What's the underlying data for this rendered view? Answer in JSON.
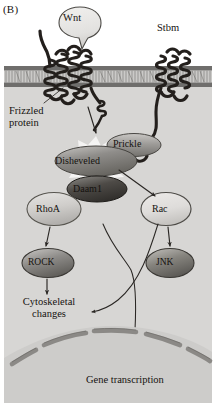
{
  "figure": {
    "panel_label": "(B)",
    "type": "planar-cell-polarity-wnt-signaling-pathway",
    "background_extracellular": "#ffffff",
    "background_cytoplasm": "#d7d6d4",
    "background_nucleus": "#cdccca",
    "membrane_color": "#6f6f6f",
    "protein_dark": "#231f1c",
    "text_color": "#15120f"
  },
  "labels": {
    "wnt": "Wnt",
    "stbm": "Stbm",
    "frizzled": "Frizzled\nprotein",
    "frizzled_line1": "Frizzled",
    "frizzled_line2": "protein",
    "prickle": "Prickle",
    "disheveled": "Disheveled",
    "daam1": "Daam1",
    "rhoa": "RhoA",
    "rac": "Rac",
    "rock": "ROCK",
    "jnk": "JNK",
    "cytoskeletal_line1": "Cytoskeletal",
    "cytoskeletal_line2": "changes",
    "gene_transcription": "Gene transcription"
  },
  "nodes": [
    {
      "id": "wnt",
      "label": "Wnt",
      "shape": "ligand-oval",
      "fill": "#e4e3e1",
      "cx": 80,
      "cy": 22,
      "rx": 21,
      "ry": 15
    },
    {
      "id": "frizzled",
      "label": "Frizzled protein",
      "shape": "seven-pass-transmembrane-receptor",
      "fill": "#231f1c"
    },
    {
      "id": "stbm",
      "label": "Stbm",
      "shape": "multi-pass-transmembrane-receptor",
      "fill": "#231f1c"
    },
    {
      "id": "prickle",
      "label": "Prickle",
      "shape": "oval",
      "fill": "#9a9895",
      "cx": 134,
      "cy": 145,
      "rx": 27,
      "ry": 11
    },
    {
      "id": "disheveled",
      "label": "Disheveled",
      "shape": "oval",
      "fill": "#8d8b88",
      "cx": 96,
      "cy": 161,
      "rx": 41,
      "ry": 15
    },
    {
      "id": "daam1",
      "label": "Daam1",
      "shape": "oval",
      "fill": "#56534f",
      "cx": 97,
      "cy": 189,
      "rx": 30,
      "ry": 13
    },
    {
      "id": "rhoa",
      "label": "RhoA",
      "shape": "oval",
      "fill": "#cdcbc8",
      "cx": 54,
      "cy": 209,
      "rx": 27,
      "ry": 16
    },
    {
      "id": "rac",
      "label": "Rac",
      "shape": "oval",
      "fill": "#e1e0de",
      "cx": 166,
      "cy": 209,
      "rx": 25,
      "ry": 16
    },
    {
      "id": "rock",
      "label": "ROCK",
      "shape": "oval",
      "fill": "#8e8c89",
      "cx": 48,
      "cy": 263,
      "rx": 26,
      "ry": 14
    },
    {
      "id": "jnk",
      "label": "JNK",
      "shape": "oval",
      "fill": "#87857f",
      "cx": 170,
      "cy": 263,
      "rx": 24,
      "ry": 14
    }
  ],
  "edges": [
    {
      "from": "frizzled",
      "to": "disheveled",
      "style": "straight-arrow"
    },
    {
      "from": "stbm",
      "to": "prickle",
      "style": "curve"
    },
    {
      "from": "disheveled",
      "to": "daam1",
      "style": "contact"
    },
    {
      "from": "daam1",
      "to": "rhoa",
      "style": "contact"
    },
    {
      "from": "disheveled",
      "to": "rac",
      "style": "straight-arrow"
    },
    {
      "from": "rhoa",
      "to": "rock",
      "style": "straight-arrow"
    },
    {
      "from": "rac",
      "to": "jnk",
      "style": "straight-arrow"
    },
    {
      "from": "rock",
      "to": "cytoskeletal-changes",
      "style": "straight-arrow"
    },
    {
      "from": "rac",
      "to": "cytoskeletal-changes",
      "style": "curved-arrow"
    },
    {
      "from": "jnk",
      "to": "gene-transcription",
      "style": "curved-arrow-into-nucleus"
    }
  ],
  "compartments": {
    "extracellular": "extracellular-space",
    "membrane": "plasma-membrane-lipid-bilayer",
    "cytoplasm": "cytoplasm",
    "nucleus": "nucleus"
  }
}
